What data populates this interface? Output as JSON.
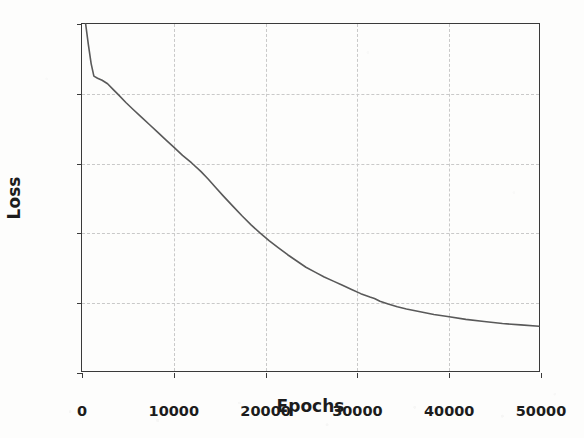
{
  "chart_data": {
    "type": "line",
    "title": "",
    "xlabel": "Epochs",
    "ylabel": "Loss",
    "xlim": [
      0,
      50000
    ],
    "ylim": [
      0.0,
      0.05
    ],
    "grid": true,
    "legend": "none",
    "xticks": [
      0,
      10000,
      20000,
      30000,
      40000,
      50000
    ],
    "xtick_labels": [
      "0",
      "10000",
      "20000",
      "30000",
      "40000",
      "50000"
    ],
    "yticks": [
      0.0,
      0.01,
      0.02,
      0.03,
      0.04,
      0.05
    ],
    "ytick_labels": [
      "0.00",
      "0.01",
      "0.02",
      "0.03",
      "0.04",
      "0.05"
    ],
    "series": [
      {
        "name": "Loss",
        "color": "#595959",
        "linewidth": 1.6,
        "x": [
          400,
          700,
          1000,
          1300,
          1700,
          2200,
          2800,
          3400,
          4000,
          4800,
          5600,
          6500,
          7400,
          8300,
          9200,
          10100,
          11000,
          12000,
          13000,
          13800,
          14600,
          15500,
          16500,
          17500,
          18500,
          19500,
          20500,
          21500,
          22500,
          23500,
          24500,
          25500,
          26500,
          27500,
          28500,
          29500,
          30500,
          31500,
          32000,
          32600,
          33500,
          34500,
          35500,
          37000,
          38500,
          40000,
          42000,
          44000,
          46000,
          48000,
          50000
        ],
        "y": [
          0.05,
          0.047,
          0.0443,
          0.0425,
          0.0422,
          0.0419,
          0.0414,
          0.0406,
          0.0398,
          0.0387,
          0.0377,
          0.0366,
          0.0355,
          0.0344,
          0.0333,
          0.0322,
          0.0311,
          0.03,
          0.0288,
          0.0277,
          0.0265,
          0.0252,
          0.0238,
          0.0224,
          0.0211,
          0.0199,
          0.0188,
          0.0178,
          0.0168,
          0.0159,
          0.015,
          0.0143,
          0.0136,
          0.013,
          0.0124,
          0.0118,
          0.0112,
          0.0107,
          0.0105,
          0.0101,
          0.0097,
          0.0093,
          0.009,
          0.0086,
          0.0082,
          0.0079,
          0.0075,
          0.0072,
          0.0069,
          0.0067,
          0.0065
        ]
      }
    ]
  }
}
